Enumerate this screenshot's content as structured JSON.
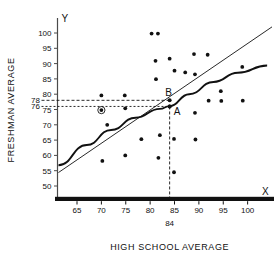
{
  "chart_data": {
    "type": "scatter",
    "title": "",
    "xlabel": "HIGH SCHOOL AVERAGE",
    "ylabel": "FRESHMAN AVERAGE",
    "x_axis_letter": "X",
    "y_axis_letter": "Y",
    "xlim": [
      61,
      105
    ],
    "ylim": [
      47,
      103
    ],
    "xticks": [
      65,
      70,
      75,
      80,
      85,
      90,
      95,
      100
    ],
    "yticks": [
      50,
      55,
      60,
      65,
      70,
      75,
      80,
      85,
      90,
      95,
      100
    ],
    "extra_yticks": [
      78,
      76
    ],
    "grid": false,
    "legend": "none",
    "points": [
      {
        "x": 70.0,
        "y": 79.6
      },
      {
        "x": 70.0,
        "y": 74.8,
        "circled": true
      },
      {
        "x": 71.2,
        "y": 70.0
      },
      {
        "x": 70.2,
        "y": 58.2
      },
      {
        "x": 74.8,
        "y": 79.6
      },
      {
        "x": 74.9,
        "y": 75.4
      },
      {
        "x": 74.9,
        "y": 60.0
      },
      {
        "x": 78.2,
        "y": 65.3
      },
      {
        "x": 80.3,
        "y": 99.8
      },
      {
        "x": 81.6,
        "y": 99.8
      },
      {
        "x": 81.1,
        "y": 90.9
      },
      {
        "x": 81.2,
        "y": 84.9
      },
      {
        "x": 81.7,
        "y": 59.2
      },
      {
        "x": 82.0,
        "y": 66.6
      },
      {
        "x": 84.0,
        "y": 91.6
      },
      {
        "x": 84.0,
        "y": 76.0
      },
      {
        "x": 85.0,
        "y": 87.7
      },
      {
        "x": 84.9,
        "y": 65.4
      },
      {
        "x": 84.9,
        "y": 54.5
      },
      {
        "x": 87.2,
        "y": 87.1
      },
      {
        "x": 89.0,
        "y": 93.1
      },
      {
        "x": 89.2,
        "y": 86.5
      },
      {
        "x": 89.2,
        "y": 73.9
      },
      {
        "x": 89.3,
        "y": 65.2
      },
      {
        "x": 91.8,
        "y": 92.9
      },
      {
        "x": 92.0,
        "y": 77.9
      },
      {
        "x": 94.5,
        "y": 81.0
      },
      {
        "x": 94.6,
        "y": 77.8
      },
      {
        "x": 98.9,
        "y": 88.9
      },
      {
        "x": 99.0,
        "y": 77.9
      }
    ],
    "regression_line": {
      "name": "straight-regression-line",
      "x_start": 61.2,
      "y_start": 54.4,
      "x_end": 105.0,
      "y_end": 102.0
    },
    "regression_curve": {
      "name": "curved-regression-line",
      "points": [
        {
          "x": 61.2,
          "y": 56.8
        },
        {
          "x": 67.0,
          "y": 63.4
        },
        {
          "x": 72.0,
          "y": 68.3
        },
        {
          "x": 77.0,
          "y": 72.3
        },
        {
          "x": 82.0,
          "y": 75.2
        },
        {
          "x": 84.0,
          "y": 76.1
        },
        {
          "x": 88.0,
          "y": 80.0
        },
        {
          "x": 93.0,
          "y": 84.0
        },
        {
          "x": 98.0,
          "y": 87.0
        },
        {
          "x": 104.0,
          "y": 89.4
        }
      ]
    },
    "annotations": [
      {
        "label": "B",
        "x": 84,
        "y": 78,
        "on": "straight-line"
      },
      {
        "label": "A",
        "x": 84,
        "y": 76,
        "on": "curve"
      }
    ],
    "reference_lines": [
      {
        "name": "h-dash-78",
        "orientation": "horizontal",
        "value": 78,
        "style": "dashed"
      },
      {
        "name": "h-dash-76",
        "orientation": "horizontal",
        "value": 76,
        "style": "dashed"
      },
      {
        "name": "v-dash-84",
        "orientation": "vertical",
        "value": 84,
        "style": "dashed"
      }
    ],
    "x_callout": "84"
  }
}
